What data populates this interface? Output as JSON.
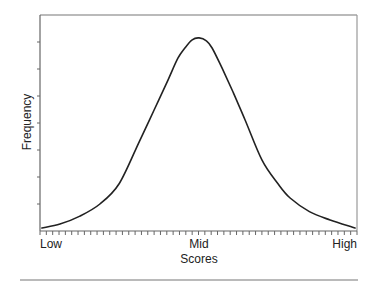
{
  "chart_data": {
    "type": "line",
    "title": "",
    "xlabel": "Scores",
    "ylabel": "Frequency",
    "x_tick_labels": [
      {
        "label": "Low",
        "position": 0.0
      },
      {
        "label": "Mid",
        "position": 0.5
      },
      {
        "label": "High",
        "position": 1.0
      }
    ],
    "x_minor_ticks": 50,
    "y_ticks": 8,
    "y_tick_labels": [],
    "xlim": [
      0,
      1
    ],
    "ylim": [
      0,
      1
    ],
    "grid": false,
    "legend": null,
    "frame": "top-right-closed box",
    "series": [
      {
        "name": "distribution",
        "color": "#222222",
        "x": [
          0.006,
          0.063,
          0.126,
          0.189,
          0.25,
          0.315,
          0.36,
          0.404,
          0.435,
          0.457,
          0.48,
          0.502,
          0.525,
          0.543,
          0.574,
          0.61,
          0.647,
          0.7,
          0.75,
          0.789,
          0.85,
          0.915,
          0.994
        ],
        "values": [
          0.014,
          0.032,
          0.069,
          0.125,
          0.22,
          0.42,
          0.56,
          0.7,
          0.8,
          0.847,
          0.885,
          0.894,
          0.88,
          0.847,
          0.755,
          0.64,
          0.514,
          0.329,
          0.22,
          0.153,
          0.09,
          0.051,
          0.014
        ]
      }
    ]
  },
  "labels": {
    "x_axis_title": "Scores",
    "y_axis_title": "Frequency",
    "low": "Low",
    "mid": "Mid",
    "high": "High"
  }
}
